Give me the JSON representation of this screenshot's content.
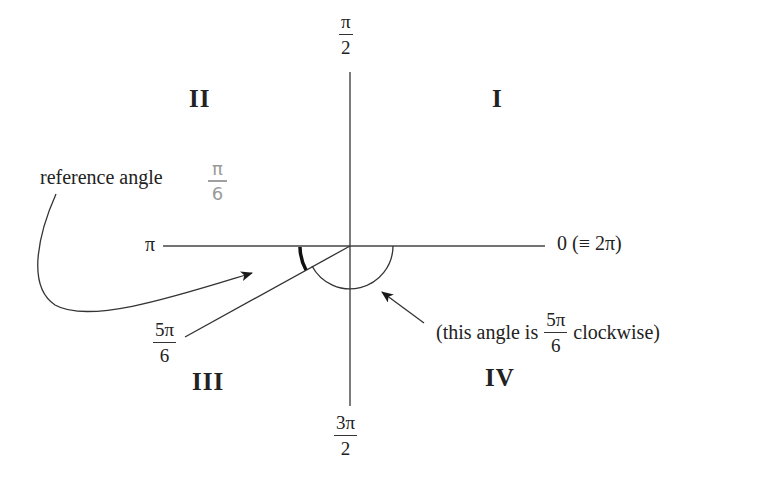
{
  "diagram": {
    "type": "unit-circle-quadrants",
    "axes": {
      "top_label": {
        "num": "π",
        "den": "2"
      },
      "bottom_label": {
        "num": "3π",
        "den": "2"
      },
      "left_label": "π",
      "right_label": "0 (≡ 2π)"
    },
    "quadrants": {
      "q1": "I",
      "q2": "II",
      "q3": "III",
      "q4": "IV"
    },
    "annotations": {
      "reference_angle_text": "reference angle",
      "reference_angle_handwritten": {
        "num": "π",
        "den": "6"
      },
      "ray_label": {
        "num": "5π",
        "den": "6"
      },
      "clockwise_prefix": "(this angle is",
      "clockwise_fraction": {
        "num": "5π",
        "den": "6"
      },
      "clockwise_suffix": "clockwise)"
    },
    "colors": {
      "line": "#333333",
      "handwriting": "#9a9a9a"
    }
  }
}
